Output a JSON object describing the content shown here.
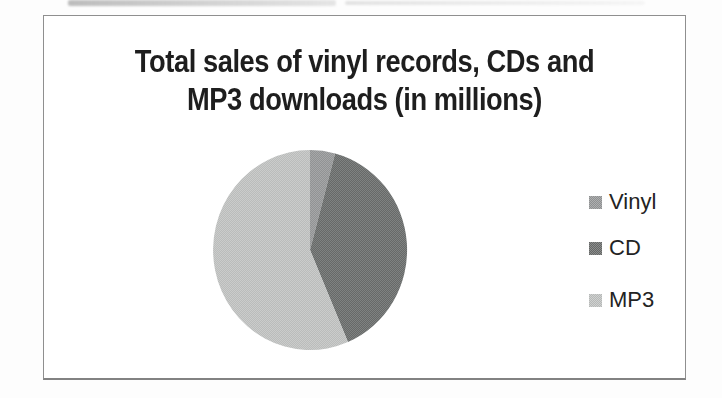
{
  "window": {
    "width": 722,
    "height": 398
  },
  "chart_data": {
    "type": "pie",
    "title": "Total sales of vinyl records, CDs and MP3 downloads (in millions)",
    "title_line1": "Total sales of vinyl records, CDs and",
    "title_line2": "MP3 downloads (in millions)",
    "units": "millions",
    "data_labels_shown": false,
    "legend_position": "right",
    "categories": [
      "Vinyl",
      "CD",
      "MP3"
    ],
    "values_percent_estimated": [
      4.2,
      39.4,
      56.4
    ],
    "slices": [
      {
        "label": "Vinyl",
        "start_deg": 0,
        "end_deg": 15,
        "color": "#97999a"
      },
      {
        "label": "CD",
        "start_deg": 15,
        "end_deg": 157,
        "color": "#6a6d6c"
      },
      {
        "label": "MP3",
        "start_deg": 157,
        "end_deg": 360,
        "color": "#c2c4c3"
      }
    ],
    "pie_geometry": {
      "cx": 310,
      "cy": 250,
      "rx": 97,
      "ry": 100,
      "start": "top",
      "direction": "clockwise"
    }
  },
  "legend": {
    "items": [
      {
        "label": "Vinyl"
      },
      {
        "label": "CD"
      },
      {
        "label": "MP3"
      }
    ]
  },
  "colors": {
    "title_text": "#1e1e1e",
    "legend_text": "#232323",
    "frame_border": "#8f8f8f",
    "background": "#fdfdfd"
  }
}
